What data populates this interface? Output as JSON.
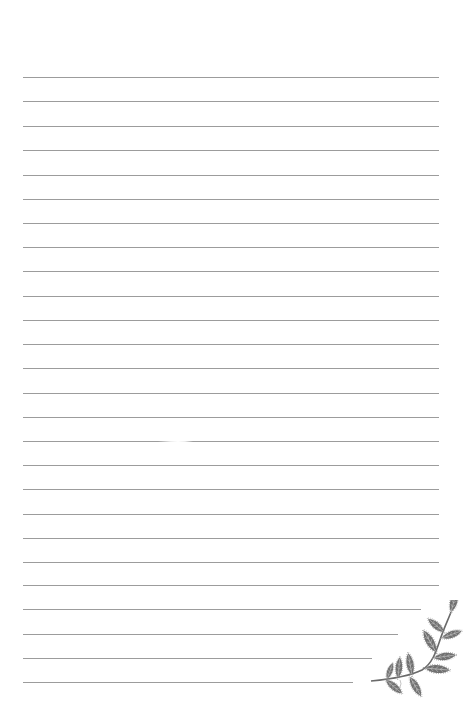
{
  "page": {
    "type": "lined-notepaper",
    "background": "#ffffff",
    "rule_color": "#9c9c9c",
    "rule_left": 23,
    "rule_full_right": 439,
    "rule_count": 26,
    "rules": [
      {
        "y": 77,
        "x2": 439
      },
      {
        "y": 101,
        "x2": 439
      },
      {
        "y": 126,
        "x2": 439
      },
      {
        "y": 150,
        "x2": 439
      },
      {
        "y": 175,
        "x2": 439
      },
      {
        "y": 199,
        "x2": 439
      },
      {
        "y": 223,
        "x2": 439
      },
      {
        "y": 247,
        "x2": 439
      },
      {
        "y": 271,
        "x2": 439
      },
      {
        "y": 296,
        "x2": 439
      },
      {
        "y": 320,
        "x2": 439
      },
      {
        "y": 344,
        "x2": 439
      },
      {
        "y": 368,
        "x2": 439
      },
      {
        "y": 393,
        "x2": 439
      },
      {
        "y": 417,
        "x2": 439
      },
      {
        "y": 441,
        "x2": 439,
        "faded_gap": true
      },
      {
        "y": 465,
        "x2": 439
      },
      {
        "y": 489,
        "x2": 439
      },
      {
        "y": 514,
        "x2": 439
      },
      {
        "y": 538,
        "x2": 439
      },
      {
        "y": 562,
        "x2": 439
      },
      {
        "y": 585,
        "x2": 439
      },
      {
        "y": 609,
        "x2": 421
      },
      {
        "y": 634,
        "x2": 398
      },
      {
        "y": 658,
        "x2": 372
      },
      {
        "y": 682,
        "x2": 353
      }
    ]
  },
  "decoration": {
    "icon": "leaf-sprig-icon",
    "position": "bottom-right",
    "leaf_color": "#6f6f6f",
    "outline_color": "#8a8a8a"
  }
}
